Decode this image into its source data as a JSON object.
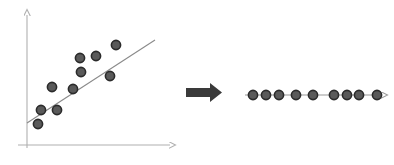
{
  "figure": {
    "title": "",
    "background": "#ffffff",
    "width": 394,
    "height": 165
  },
  "colors": {
    "axis": "#b0b0b0",
    "point_fill": "#5a5a5a",
    "point_stroke": "#2b2b2b",
    "trend_line": "#8a8a8a",
    "projection_line": "#9a9a9a",
    "block_arrow": "#3a3a3a"
  },
  "left_panel": {
    "name": "scatter-plot-with-regression-line",
    "axes": {
      "y_axis": {
        "x": 27,
        "y_top": 13,
        "y_bottom": 148,
        "arrow": "up"
      },
      "x_axis": {
        "y": 145,
        "x_left": 18,
        "x_right": 174,
        "arrow": "right"
      }
    },
    "trend_line": {
      "x1": 27,
      "y1": 123,
      "x2": 155,
      "y2": 40
    },
    "point_radius": 4.6
  },
  "right_panel": {
    "name": "projected-points-on-line",
    "axis_line": {
      "y": 95,
      "x_left": 245,
      "x_right": 386,
      "arrow": "right"
    },
    "point_radius": 4.6
  },
  "block_arrow": {
    "name": "transform-arrow",
    "direction": "right",
    "x": 186,
    "y": 86,
    "width": 36,
    "height": 13
  },
  "chart_data": {
    "type": "scatter",
    "title": "",
    "xlabel": "",
    "ylabel": "",
    "grid": false,
    "legend": null,
    "xlim": [
      18,
      174
    ],
    "ylim": [
      13,
      145
    ],
    "annotations": [
      "Projection of 2-D scatter points onto the first principal component (1-D line)"
    ],
    "series": [
      {
        "name": "original-points",
        "panel": "left",
        "px": [
          38,
          41,
          57,
          52,
          73,
          81,
          80,
          96,
          110,
          116
        ],
        "py": [
          124,
          110,
          110,
          87,
          89,
          72,
          58,
          56,
          76,
          45
        ]
      },
      {
        "name": "projected-points",
        "panel": "right",
        "px": [
          253,
          266,
          279,
          296,
          313,
          334,
          347,
          359,
          377
        ],
        "py": [
          95,
          95,
          95,
          95,
          95,
          95,
          95,
          95,
          95
        ]
      }
    ],
    "fit_line": {
      "name": "regression-line",
      "x": [
        27,
        155
      ],
      "y": [
        123,
        40
      ]
    }
  }
}
